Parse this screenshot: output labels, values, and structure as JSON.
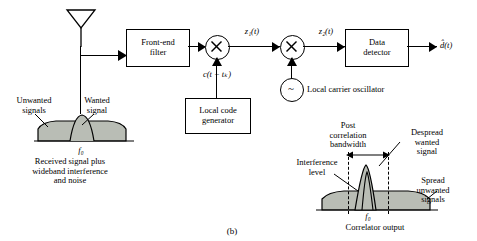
{
  "figure": {
    "caption": "(b)",
    "blocks": [
      {
        "id": "front_end_filter",
        "label": "Front-end\nfilter"
      },
      {
        "id": "local_code_generator",
        "label": "Local code\ngenerator"
      },
      {
        "id": "data_detector",
        "label": "Data\ndetector"
      }
    ],
    "mixers": [
      {
        "id": "mixer1",
        "symbol": "×"
      },
      {
        "id": "mixer2",
        "symbol": "×"
      }
    ],
    "oscillator": {
      "id": "local_carrier_oscillator",
      "symbol": "~",
      "label": "Local carrier oscillator"
    },
    "signals": {
      "z1": "z₁(t)",
      "z2": "z₂(t)",
      "code": "c(t − tₖ)",
      "output": "d̂(t)"
    },
    "left_spectrum": {
      "unwanted_label": "Unwanted\nsignals",
      "wanted_label": "Wanted\nsignal",
      "center_freq": "f₀",
      "caption": "Received signal plus\nwideband interference\nand noise"
    },
    "right_spectrum": {
      "post_corr_label": "Post\ncorrelation\nbandwidth",
      "despread_label": "Despread\nwanted\nsignal",
      "interference_label": "Interference\nlevel",
      "spread_label": "Spread\nunwanted\nsignals",
      "center_freq": "f₀",
      "caption": "Correlator output"
    },
    "colors": {
      "line": "#000000",
      "spectrum_fill": "#b9bdb5",
      "spectrum_stroke": "#000000",
      "background": "#ffffff"
    }
  }
}
